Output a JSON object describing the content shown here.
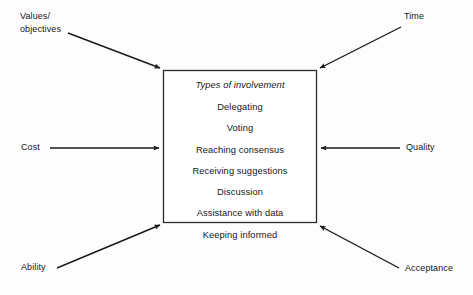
{
  "diagram": {
    "central_box": {
      "heading": "Types of involvement",
      "items": [
        "Delegating",
        "Voting",
        "Reaching consensus",
        "Receiving suggestions",
        "Discussion",
        "Assistance with data",
        "Keeping informed"
      ]
    },
    "inputs": [
      {
        "id": "values-objectives",
        "label_line1": "Values/",
        "label_line2": "objectives",
        "position": "top-left",
        "arrow": "diagonal-down-right"
      },
      {
        "id": "time",
        "label": "Time",
        "position": "top-right",
        "arrow": "diagonal-down-left"
      },
      {
        "id": "cost",
        "label": "Cost",
        "position": "middle-left",
        "arrow": "horizontal-right"
      },
      {
        "id": "quality",
        "label": "Quality",
        "position": "middle-right",
        "arrow": "horizontal-left"
      },
      {
        "id": "ability",
        "label": "Ability",
        "position": "bottom-left",
        "arrow": "diagonal-up-right"
      },
      {
        "id": "acceptance",
        "label": "Acceptance",
        "position": "bottom-right",
        "arrow": "diagonal-up-left"
      }
    ],
    "colors": {
      "stroke": "#1a1a1a",
      "text": "#16161a",
      "background": "#fdfdfd",
      "box_fill": "#ffffff"
    }
  }
}
